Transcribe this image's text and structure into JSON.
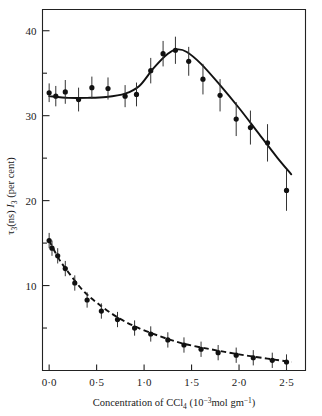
{
  "figure": {
    "background_color": "#ffffff",
    "ink_color": "#111111"
  },
  "axes": {
    "x": {
      "label_parts": {
        "main": "Concentration of CCl",
        "sub1": "4",
        "open": " (10",
        "exp1": "−3",
        "mid": "mol gm",
        "exp2": "−1",
        "close": ")"
      },
      "label_plain": "Concentration of CCl4 (10−3 mol gm−1)",
      "tick_labels": [
        "0·0",
        "0·5",
        "1·0",
        "1·5",
        "2·0",
        "2·5"
      ],
      "tick_values": [
        0.0,
        0.5,
        1.0,
        1.5,
        2.0,
        2.5
      ],
      "range": [
        -0.07,
        2.7
      ]
    },
    "y": {
      "label_parts": {
        "tau": "τ",
        "tau_sub": "3",
        "ns": "(ns)",
        "I": "I",
        "I_sub": "3",
        "units": "(per cent)"
      },
      "label_plain": "τ3(ns) I3 (per cent)",
      "tick_labels": [
        "40",
        "30",
        "20",
        "10"
      ],
      "tick_values": [
        40,
        30,
        20,
        10
      ],
      "minor_tick_values": [
        35,
        25,
        15,
        5
      ],
      "range": [
        0,
        42.5
      ]
    }
  },
  "chart_data": {
    "type": "scatter",
    "title": "",
    "xlabel": "Concentration of CCl4 (10−3 mol gm−1)",
    "ylabel": "τ3(ns) I3 (per cent)",
    "xlim": [
      -0.07,
      2.7
    ],
    "ylim": [
      0,
      42.5
    ],
    "grid": false,
    "legend": "none",
    "series": [
      {
        "name": "I3 (per cent)",
        "style": "solid-line-with-points",
        "x": [
          0.0,
          0.07,
          0.17,
          0.31,
          0.45,
          0.62,
          0.8,
          0.92,
          1.07,
          1.2,
          1.33,
          1.47,
          1.62,
          1.8,
          1.97,
          2.12,
          2.3,
          2.5
        ],
        "y": [
          32.7,
          32.3,
          32.8,
          31.9,
          33.3,
          33.2,
          32.3,
          32.5,
          35.3,
          37.3,
          37.7,
          36.4,
          34.3,
          32.4,
          29.6,
          28.6,
          26.8,
          21.2
        ],
        "yerr": [
          1.1,
          1.2,
          1.4,
          1.4,
          1.3,
          1.3,
          1.3,
          1.4,
          1.5,
          1.5,
          1.6,
          1.7,
          1.8,
          1.9,
          2.0,
          2.0,
          2.2,
          2.4
        ]
      },
      {
        "name": "τ3 (ns)",
        "style": "dashed-line-with-points",
        "x": [
          0.0,
          0.03,
          0.09,
          0.17,
          0.27,
          0.4,
          0.55,
          0.72,
          0.9,
          1.07,
          1.25,
          1.42,
          1.6,
          1.78,
          1.97,
          2.15,
          2.35,
          2.5
        ],
        "y": [
          15.3,
          14.4,
          13.5,
          12.0,
          10.3,
          8.3,
          7.0,
          6.0,
          5.0,
          4.3,
          3.6,
          3.0,
          2.5,
          2.1,
          1.8,
          1.5,
          1.2,
          1.0
        ],
        "yerr": [
          0.9,
          0.9,
          0.9,
          0.9,
          0.9,
          0.9,
          0.9,
          0.9,
          0.9,
          0.9,
          0.9,
          0.9,
          0.9,
          0.9,
          0.9,
          0.9,
          0.9,
          0.9
        ]
      }
    ],
    "fit_curves": [
      {
        "name": "I3 fitted curve",
        "style": "solid",
        "points_x": [
          0.0,
          0.2,
          0.4,
          0.6,
          0.8,
          0.95,
          1.1,
          1.25,
          1.35,
          1.45,
          1.6,
          1.8,
          2.0,
          2.2,
          2.4,
          2.55
        ],
        "points_y": [
          32.3,
          32.1,
          32.1,
          32.2,
          32.6,
          33.5,
          35.6,
          37.3,
          37.8,
          37.5,
          36.1,
          33.6,
          30.9,
          28.0,
          25.1,
          23.1
        ]
      },
      {
        "name": "τ3 fitted curve",
        "style": "dashed",
        "points_x": [
          0.0,
          0.1,
          0.2,
          0.35,
          0.5,
          0.7,
          0.9,
          1.15,
          1.4,
          1.7,
          2.0,
          2.3,
          2.55
        ],
        "points_y": [
          15.3,
          13.2,
          11.6,
          9.5,
          8.0,
          6.4,
          5.2,
          4.1,
          3.2,
          2.5,
          1.9,
          1.4,
          1.0
        ]
      }
    ]
  }
}
